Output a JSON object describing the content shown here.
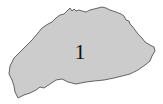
{
  "map": {
    "regions": [
      {
        "label": "1",
        "fill": "#cccccc",
        "stroke": "#555555"
      }
    ]
  },
  "colors": {
    "background": "#ffffff",
    "region_fill": "#cccccc",
    "region_stroke": "#555555",
    "label_color": "#111111"
  }
}
